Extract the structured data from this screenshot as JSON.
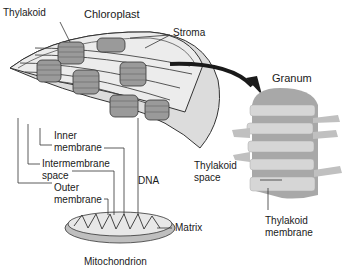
{
  "diagram": {
    "chloroplast": {
      "title": "Chloroplast",
      "labels": {
        "thylakoid": "Thylakoid",
        "stroma": "Stroma"
      }
    },
    "granum": {
      "title": "Granum",
      "labels": {
        "thylakoid_space_1": "Thylakoid",
        "thylakoid_space_2": "space",
        "thylakoid_membrane_1": "Thylakoid",
        "thylakoid_membrane_2": "membrane"
      }
    },
    "mitochondrion": {
      "title": "Mitochondrion",
      "labels": {
        "inner_membrane_1": "Inner",
        "inner_membrane_2": "membrane",
        "intermembrane_space_1": "Intermembrane",
        "intermembrane_space_2": "space",
        "outer_membrane_1": "Outer",
        "outer_membrane_2": "membrane",
        "dna": "DNA",
        "matrix": "Matrix"
      }
    },
    "colors": {
      "grana_fill": "#9a9a9a",
      "stroma_fill": "#e4e4e4",
      "outline": "#333333",
      "granum_light": "#d6d6d6",
      "granum_dark": "#a8a8a8",
      "arrow": "#1a1a1a"
    }
  }
}
